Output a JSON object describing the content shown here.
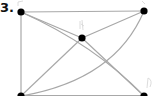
{
  "problem": {
    "number_label": "3."
  },
  "graph": {
    "vertices": [
      {
        "id": "top-left",
        "x": 21,
        "y": 12,
        "mark": "faint handwritten F"
      },
      {
        "id": "top-right",
        "x": 144,
        "y": 11,
        "mark": "faint handwritten stroke"
      },
      {
        "id": "center",
        "x": 82,
        "y": 38,
        "mark": "faint handwritten stroke"
      },
      {
        "id": "bottom-left",
        "x": 21,
        "y": 96,
        "mark": ""
      },
      {
        "id": "bottom-right",
        "x": 144,
        "y": 96,
        "mark": "faint handwritten stroke"
      }
    ],
    "edges": [
      [
        "top-left",
        "top-right"
      ],
      [
        "top-left",
        "bottom-left"
      ],
      [
        "top-left",
        "center"
      ],
      [
        "top-right",
        "center"
      ],
      [
        "top-left",
        "bottom-right"
      ],
      [
        "top-right",
        "bottom-left"
      ],
      [
        "center",
        "bottom-left"
      ],
      [
        "center",
        "bottom-right"
      ],
      [
        "bottom-left",
        "bottom-right"
      ]
    ],
    "colors": {
      "vertex": "#000000",
      "edge": "#a8a8a8",
      "marks": "#d8d8d8"
    }
  }
}
